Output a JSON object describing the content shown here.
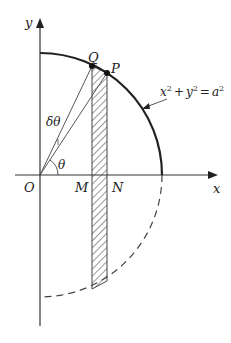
{
  "diagram": {
    "axes": {
      "x_label": "x",
      "y_label": "y",
      "origin_label": "O"
    },
    "points": {
      "Q": "Q",
      "P": "P",
      "M": "M",
      "N": "N"
    },
    "angles": {
      "theta": "θ",
      "delta_theta": "δθ"
    },
    "equation": {
      "lhs_x": "x",
      "lhs_y": "y",
      "rhs": "a",
      "exp": "2",
      "plus": "+",
      "equals": "="
    },
    "colors": {
      "stroke": "#222222",
      "thin": "#444444",
      "background": "#ffffff"
    }
  }
}
